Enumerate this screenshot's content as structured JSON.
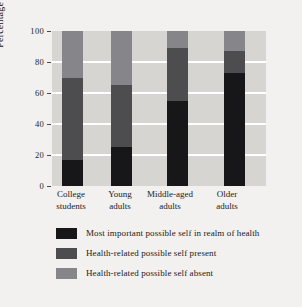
{
  "chart_data": {
    "type": "bar",
    "subtype": "stacked-100",
    "title": "",
    "xlabel": "",
    "ylabel": "Percentage of sample",
    "ylim": [
      0,
      100
    ],
    "yticks": [
      0,
      20,
      40,
      60,
      80,
      100
    ],
    "ytick_labels": [
      "0",
      "20",
      "40",
      "60",
      "80",
      "100"
    ],
    "grid": "horizontal",
    "legend_position": "below",
    "categories": [
      "College students",
      "Young adults",
      "Middle-aged adults",
      "Older adults"
    ],
    "category_lines": [
      [
        "College",
        "students"
      ],
      [
        "Young",
        "adults"
      ],
      [
        "Middle-aged",
        "adults"
      ],
      [
        "Older",
        "adults"
      ]
    ],
    "series": [
      {
        "name": "Most important possible self in realm of health",
        "color": "#17171a",
        "values": [
          17,
          25,
          55,
          73
        ]
      },
      {
        "name": "Health-related possible self present",
        "color": "#4d4d50",
        "values": [
          53,
          40,
          34,
          14
        ]
      },
      {
        "name": "Health-related possible self absent",
        "color": "#86868a",
        "values": [
          30,
          35,
          11,
          13
        ]
      }
    ],
    "cumulative_tops": {
      "most_important": [
        17,
        25,
        55,
        73
      ],
      "present": [
        70,
        65,
        89,
        87
      ],
      "absent": [
        100,
        100,
        100,
        100
      ]
    }
  },
  "legend": {
    "items": [
      {
        "label": "Most important possible self in realm of health",
        "color": "#17171a"
      },
      {
        "label": "Health-related possible self present",
        "color": "#4d4d50"
      },
      {
        "label": "Health-related possible self absent",
        "color": "#86868a"
      }
    ]
  },
  "colors": {
    "figure_background": "#f2f1ef",
    "plot_background": "#d6d5d1",
    "gridline": "#ffffff",
    "text": "#1a1a1a"
  }
}
